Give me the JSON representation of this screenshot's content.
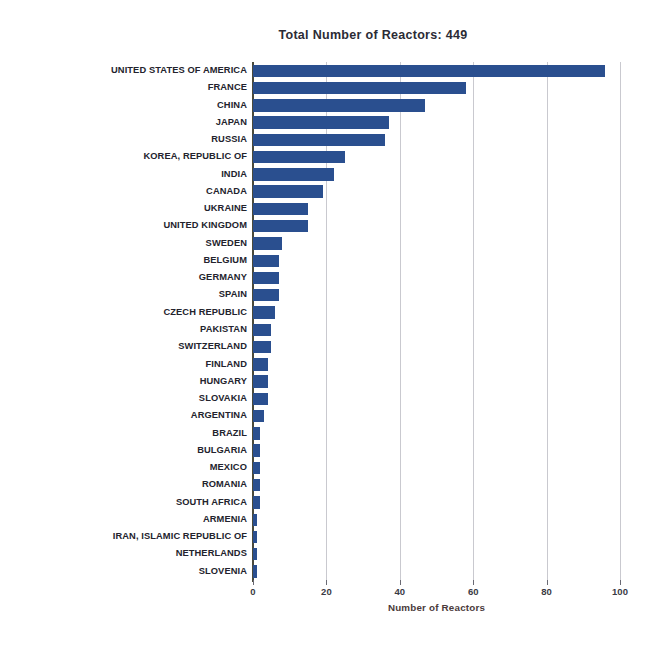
{
  "chart_data": {
    "type": "bar",
    "orientation": "horizontal",
    "title": "Total Number of Reactors: 449",
    "xlabel": "Number of Reactors",
    "ylabel": "",
    "xlim": [
      0,
      100
    ],
    "xticks": [
      0,
      20,
      40,
      60,
      80,
      100
    ],
    "xtick_labels": [
      "0",
      "20",
      "40",
      "60",
      "80",
      "100"
    ],
    "grid": "vertical",
    "legend": "none",
    "bar_color": "#2a4f8f",
    "total": 449,
    "categories": [
      "UNITED STATES OF AMERICA",
      "FRANCE",
      "CHINA",
      "JAPAN",
      "RUSSIA",
      "KOREA, REPUBLIC OF",
      "INDIA",
      "CANADA",
      "UKRAINE",
      "UNITED KINGDOM",
      "SWEDEN",
      "BELGIUM",
      "GERMANY",
      "SPAIN",
      "CZECH REPUBLIC",
      "PAKISTAN",
      "SWITZERLAND",
      "FINLAND",
      "HUNGARY",
      "SLOVAKIA",
      "ARGENTINA",
      "BRAZIL",
      "BULGARIA",
      "MEXICO",
      "ROMANIA",
      "SOUTH AFRICA",
      "ARMENIA",
      "IRAN, ISLAMIC REPUBLIC OF",
      "NETHERLANDS",
      "SLOVENIA"
    ],
    "values": [
      96,
      58,
      47,
      37,
      36,
      25,
      22,
      19,
      15,
      15,
      8,
      7,
      7,
      7,
      6,
      5,
      5,
      4,
      4,
      4,
      3,
      2,
      2,
      2,
      2,
      2,
      1,
      1,
      1,
      1
    ]
  }
}
